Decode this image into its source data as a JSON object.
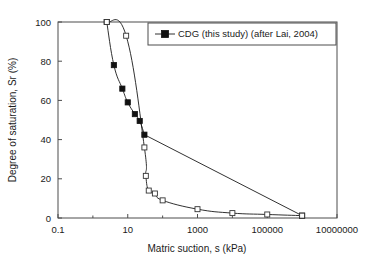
{
  "chart_data": {
    "type": "line",
    "title": "",
    "xlabel": "Matric suction, s (kPa)",
    "ylabel": "Degree of saturation, Sr (%)",
    "xscale": "log",
    "yscale": "linear",
    "xlim": [
      0.1,
      10000000
    ],
    "ylim": [
      0,
      100
    ],
    "grid": false,
    "legend_position": "top-right",
    "xticks": [
      "0.1",
      "10",
      "1000",
      "100000",
      "10000000"
    ],
    "xtick_values": [
      0.1,
      10,
      1000,
      100000,
      10000000
    ],
    "yticks": [
      "0",
      "20",
      "40",
      "60",
      "80",
      "100"
    ],
    "ytick_values": [
      0,
      20,
      40,
      60,
      80,
      100
    ],
    "series": [
      {
        "name": "CDG (this study)",
        "marker": "filled-square",
        "x": [
          2.5,
          4.0,
          7.0,
          10.0,
          16.0,
          22.0,
          30.0,
          1000000.0
        ],
        "y": [
          100.0,
          78.0,
          66.0,
          59.0,
          53.0,
          49.5,
          42.5,
          1.2
        ]
      },
      {
        "name": "after Lai, 2004",
        "marker": "open-square",
        "x": [
          2.5,
          9.0,
          30.0,
          33.0,
          40.0,
          60.0,
          100.0,
          1000.0,
          10000.0,
          100000.0,
          1000000.0
        ],
        "y": [
          100.0,
          93.0,
          36.0,
          21.5,
          14.0,
          12.5,
          9.0,
          4.5,
          2.5,
          1.8,
          1.2
        ]
      }
    ],
    "legend_entries": [
      {
        "label": "CDG (this study) (after Lai, 2004)",
        "marker": "filled-square"
      }
    ]
  }
}
